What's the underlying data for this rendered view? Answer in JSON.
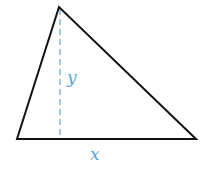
{
  "diagram": {
    "labels": {
      "height": "y",
      "base": "x"
    },
    "vertices": {
      "apex": [
        59,
        7
      ],
      "bottom_left": [
        17,
        139
      ],
      "bottom_right": [
        196,
        139
      ]
    },
    "altitude_foot": [
      60,
      139
    ],
    "colors": {
      "triangle_stroke": "#111111",
      "altitude_stroke": "#6fb0d8",
      "label_color": "#5aa6d6",
      "background": "#ffffff"
    }
  }
}
